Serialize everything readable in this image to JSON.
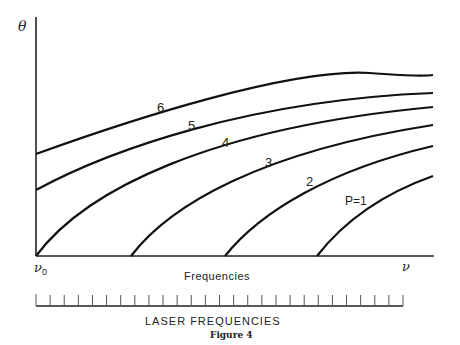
{
  "chart_data": {
    "type": "line",
    "title": "",
    "caption": "Figure 4",
    "xlabel": "Frequencies",
    "ylabel": "θ",
    "x_axis_start_label": "ν₀",
    "x_axis_end_label": "ν",
    "grid": false,
    "legend": "inline curve labels",
    "series": [
      {
        "name": "P=1",
        "label": "P=1",
        "start_x_fraction": 0.75
      },
      {
        "name": "P=2",
        "label": "2",
        "start_x_fraction": 0.5
      },
      {
        "name": "P=3",
        "label": "3",
        "start_x_fraction": 0.25
      },
      {
        "name": "P=4",
        "label": "4",
        "start_x_fraction": 0.0
      },
      {
        "name": "P=5",
        "label": "5",
        "start_y_fraction": 0.3
      },
      {
        "name": "P=6",
        "label": "6",
        "start_y_fraction": 0.46
      }
    ],
    "scale_bar": {
      "label": "LASER FREQUENCIES",
      "tick_count": 27
    }
  },
  "labels": {
    "theta": "θ",
    "nu0": "ν",
    "nu0_sub": "0",
    "nu": "ν",
    "frequencies": "Frequencies",
    "laser": "LASER FREQUENCIES",
    "figure": "Figure 4",
    "c1": "P=1",
    "c2": "2",
    "c3": "3",
    "c4": "4",
    "c5": "5",
    "c6": "6"
  }
}
